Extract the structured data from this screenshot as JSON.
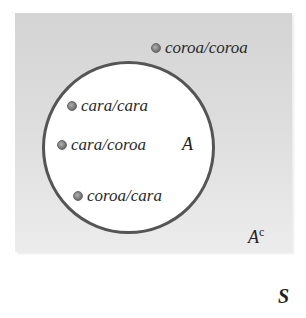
{
  "diagram": {
    "type": "venn",
    "sample_space": {
      "label": "S"
    },
    "event": {
      "label": "A"
    },
    "complement": {
      "label": "A",
      "superscript": "c"
    },
    "outcomes_in_A": [
      {
        "label": "cara/cara"
      },
      {
        "label": "cara/coroa"
      },
      {
        "label": "coroa/cara"
      }
    ],
    "outcomes_in_complement": [
      {
        "label": "coroa/coroa"
      }
    ],
    "colors": {
      "background_gray": "#d8d8d8",
      "circle_fill": "#ffffff",
      "circle_stroke": "#555555",
      "text": "#2a2a2a"
    }
  }
}
